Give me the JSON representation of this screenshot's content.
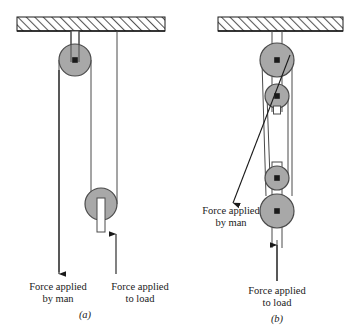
{
  "figure": {
    "background": "#ffffff",
    "ink": "#1a1a1a",
    "pulley_fill": "#a8a8a8",
    "pulley_stroke": "#4a4a4a",
    "hatch_color": "#555555",
    "rope_color": "#4a4a4a"
  },
  "panels": [
    {
      "id": "a",
      "label": "(a)",
      "ceiling": {
        "x": 17,
        "y": 17,
        "width": 148,
        "height": 14
      },
      "pulleys": [
        {
          "name": "fixed-pulley",
          "cx": 75,
          "cy": 60,
          "r": 16
        },
        {
          "name": "movable-pulley",
          "cx": 101,
          "cy": 204,
          "r": 16
        }
      ],
      "labels": [
        {
          "name": "force-by-man",
          "text": "Force applied\nby man",
          "x": 11,
          "y": 281,
          "arrow": "down",
          "arrow_x": 61,
          "arrow_top": 70,
          "arrow_tip": 276
        },
        {
          "name": "force-to-load",
          "text": "Force applied\nto load",
          "x": 87,
          "y": 281,
          "arrow": "up",
          "arrow_x": 116,
          "arrow_top": 276,
          "arrow_tip": 232
        }
      ]
    },
    {
      "id": "b",
      "label": "(b)",
      "ceiling": {
        "x": 218,
        "y": 17,
        "width": 125,
        "height": 14
      },
      "pulleys": [
        {
          "name": "upper-block-large-pulley",
          "cx": 277,
          "cy": 60,
          "r": 17
        },
        {
          "name": "upper-block-small-pulley",
          "cx": 277,
          "cy": 96,
          "r": 12
        },
        {
          "name": "lower-block-small-pulley",
          "cx": 277,
          "cy": 178,
          "r": 12
        },
        {
          "name": "lower-block-large-pulley",
          "cx": 277,
          "cy": 211,
          "r": 17
        }
      ],
      "labels": [
        {
          "name": "force-by-man",
          "text": "Force applied\nby man",
          "x": 183,
          "y": 209,
          "arrow": "diagonal-down-left",
          "from_x": 289,
          "from_y": 60,
          "tip_x": 234,
          "tip_y": 202
        },
        {
          "name": "force-to-load",
          "text": "Force applied\nto load",
          "x": 241,
          "y": 285,
          "arrow": "up",
          "arrow_x": 277,
          "arrow_top": 281,
          "arrow_tip": 243
        }
      ]
    }
  ],
  "captions": {
    "force_by_man": "Force applied\nby man",
    "force_to_load": "Force applied\nto load",
    "panel_a": "(a)",
    "panel_b": "(b)"
  }
}
